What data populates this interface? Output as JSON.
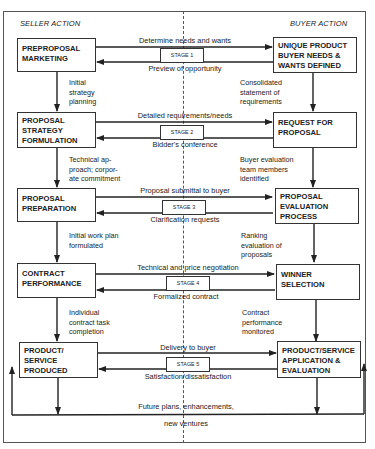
{
  "header": {
    "seller_label": "SELLER ACTION",
    "buyer_label": "BUYER ACTION"
  },
  "stages": [
    {
      "stage_label": "STAGE 1",
      "seller_box": "PREPROPOSAL\nMARKETING",
      "buyer_box": "UNIQUE PRODUCT\nBUYER NEEDS &\nWANTS DEFINED",
      "to_buyer": "Determine needs and wants",
      "to_seller": "Preview of opportunity",
      "seller_transition": "Initial\nstrategy\nplanning",
      "buyer_transition": "Consolidated\nstatement of\nrequirements"
    },
    {
      "stage_label": "STAGE 2",
      "seller_box": "PROPOSAL\nSTRATEGY\nFORMULATION",
      "buyer_box": "REQUEST FOR\nPROPOSAL",
      "to_buyer": "Detailed requirements/needs",
      "to_seller": "Bidder's conference",
      "seller_transition": "Technical ap-\nproach; corpor-\nate commitment",
      "buyer_transition": "Buyer evaluation\nteam members\nidentified"
    },
    {
      "stage_label": "STAGE 3",
      "seller_box": "PROPOSAL\nPREPARATION",
      "buyer_box": "PROPOSAL\nEVALUATION\nPROCESS",
      "to_buyer": "Proposal submittal to buyer",
      "to_seller": "Clarification requests",
      "seller_transition": "Initial work plan\nformulated",
      "buyer_transition": "Ranking\nevaluation of\nproposals"
    },
    {
      "stage_label": "STAGE 4",
      "seller_box": "CONTRACT\nPERFORMANCE",
      "buyer_box": "WINNER\nSELECTION",
      "to_buyer": "Technical and price negotiation",
      "to_seller": "Formalized contract",
      "seller_transition": "Individual\ncontract task\ncompletion",
      "buyer_transition": "Contract\nperformance\nmonitored"
    },
    {
      "stage_label": "STAGE 5",
      "seller_box": "PRODUCT/\nSERVICE\nPRODUCED",
      "buyer_box": "PRODUCT/SERVICE\nAPPLICATION &\nEVALUATION",
      "to_buyer": "Delivery to buyer",
      "to_seller": "Satisfaction/dissatisfaction"
    }
  ],
  "feedback_loop": {
    "line1": "Future plans, enhancements,",
    "line2": "new ventures"
  }
}
